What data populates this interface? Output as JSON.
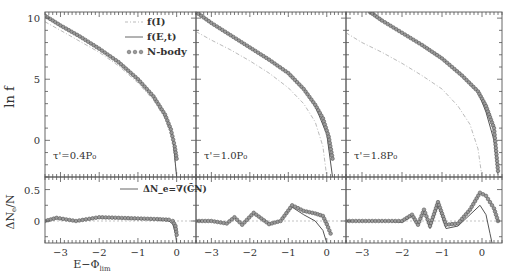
{
  "figure": {
    "ylabel_top": "ln f",
    "ylabel_bottom": "ΔN_e/N",
    "xlabel": "E−Φ_lim",
    "legend": {
      "fI": "f(I)",
      "fEt": "f(E,t)",
      "nbody": "N-body",
      "delta": "ΔN_e=∇(C̃N)"
    },
    "panels": [
      {
        "label": "τ'=0.4P₀"
      },
      {
        "label": "τ'=1.0P₀"
      },
      {
        "label": "τ'=1.8P₀"
      }
    ],
    "top_yticks": [
      "10",
      "5",
      "0"
    ],
    "bottom_yticks": [
      "0.5",
      "0"
    ],
    "xticks": [
      "−3",
      "−2",
      "−1",
      "0"
    ]
  },
  "chart_data": [
    {
      "type": "line",
      "title": "Top row: ln f vs E−Φ_lim",
      "xlabel": "E−Φ_lim",
      "ylabel": "ln f",
      "xlim": [
        -3.4,
        0.5
      ],
      "ylim": [
        -3,
        10.5
      ],
      "panels": [
        {
          "label": "τ'=0.4P₀",
          "series": [
            {
              "name": "f(I)",
              "style": "dash-dot",
              "x": [
                -3.4,
                -3,
                -2.5,
                -2,
                -1.5,
                -1,
                -0.6,
                -0.3,
                -0.1,
                0.0
              ],
              "y": [
                9.7,
                9.0,
                8.1,
                7.2,
                6.1,
                4.7,
                3.3,
                1.8,
                0.0,
                -3.0
              ]
            },
            {
              "name": "f(E,t)",
              "style": "solid",
              "x": [
                -3.4,
                -3,
                -2.5,
                -2,
                -1.5,
                -1,
                -0.6,
                -0.3,
                -0.1,
                0.0
              ],
              "y": [
                10.2,
                9.4,
                8.5,
                7.5,
                6.4,
                5.0,
                3.6,
                2.0,
                0.3,
                -3.0
              ]
            },
            {
              "name": "N-body",
              "style": "markers",
              "x": [
                -3.4,
                -3,
                -2.5,
                -2,
                -1.5,
                -1,
                -0.6,
                -0.3,
                -0.15,
                -0.05,
                0.0
              ],
              "y": [
                10.2,
                9.4,
                8.5,
                7.5,
                6.4,
                5.0,
                3.6,
                2.1,
                0.9,
                -0.5,
                -1.5
              ]
            }
          ]
        },
        {
          "label": "τ'=1.0P₀",
          "series": [
            {
              "name": "f(I)",
              "style": "dash-dot",
              "x": [
                -3.4,
                -3,
                -2.5,
                -2,
                -1.5,
                -1,
                -0.6,
                -0.3,
                -0.1,
                0.0
              ],
              "y": [
                8.9,
                8.2,
                7.4,
                6.5,
                5.5,
                4.3,
                3.0,
                1.5,
                -0.5,
                -3.0
              ]
            },
            {
              "name": "f(E,t)",
              "style": "solid",
              "x": [
                -3.4,
                -3,
                -2.5,
                -2,
                -1.5,
                -1,
                -0.6,
                -0.3,
                0.0,
                0.15
              ],
              "y": [
                10.5,
                9.6,
                8.6,
                7.6,
                6.6,
                5.5,
                4.2,
                2.8,
                0.5,
                -3.0
              ]
            },
            {
              "name": "N-body",
              "style": "markers",
              "x": [
                -3.4,
                -3,
                -2.5,
                -2,
                -1.5,
                -1,
                -0.6,
                -0.3,
                -0.1,
                0.05,
                0.15
              ],
              "y": [
                10.5,
                9.6,
                8.6,
                7.6,
                6.6,
                5.5,
                4.2,
                2.9,
                1.8,
                0.3,
                -1.5
              ]
            }
          ]
        },
        {
          "label": "τ'=1.8P₀",
          "series": [
            {
              "name": "f(I)",
              "style": "dash-dot",
              "x": [
                -3.4,
                -3,
                -2.5,
                -2,
                -1.5,
                -1,
                -0.6,
                -0.3,
                -0.1,
                0.0
              ],
              "y": [
                8.8,
                8.0,
                7.2,
                6.3,
                5.3,
                4.2,
                2.8,
                1.3,
                -0.7,
                -3.0
              ]
            },
            {
              "name": "f(E,t)",
              "style": "solid",
              "x": [
                -2.8,
                -2.5,
                -2,
                -1.5,
                -1,
                -0.5,
                -0.1,
                0.1,
                0.3,
                0.4
              ],
              "y": [
                10.5,
                9.8,
                8.8,
                7.8,
                6.7,
                5.3,
                4.0,
                2.3,
                0.0,
                -2.8
              ]
            },
            {
              "name": "N-body",
              "style": "markers",
              "x": [
                -2.8,
                -2.5,
                -2,
                -1.5,
                -1,
                -0.5,
                -0.1,
                0.0,
                0.1,
                0.2,
                0.3,
                0.4
              ],
              "y": [
                10.5,
                9.8,
                8.8,
                7.8,
                6.7,
                5.3,
                4.0,
                3.4,
                2.8,
                1.9,
                1.0,
                -2.5
              ]
            }
          ]
        }
      ]
    },
    {
      "type": "line",
      "title": "Bottom row: ΔN_e/N vs E−Φ_lim",
      "xlabel": "E−Φ_lim",
      "ylabel": "ΔN_e/N",
      "xlim": [
        -3.4,
        0.5
      ],
      "ylim": [
        -0.35,
        0.7
      ],
      "reference_line": {
        "y": 0,
        "style": "dotted"
      },
      "panels": [
        {
          "label": "τ'=0.4P₀",
          "series": [
            {
              "name": "ΔN_e=∇(C̃N)",
              "style": "solid",
              "x": [
                -3.4,
                -3.1,
                -2.6,
                -2.0,
                -1.5,
                -1.0,
                -0.5,
                -0.2,
                -0.1,
                -0.03,
                0.0
              ],
              "y": [
                0.0,
                0.04,
                0.0,
                0.05,
                0.04,
                0.03,
                0.02,
                0.0,
                -0.05,
                -0.2,
                -0.35
              ]
            },
            {
              "name": "N-body",
              "style": "markers",
              "x": [
                -3.4,
                -3.1,
                -2.6,
                -2.0,
                -1.5,
                -1.0,
                -0.5,
                -0.2,
                -0.1,
                -0.03,
                0.0
              ],
              "y": [
                0.0,
                0.05,
                0.0,
                0.06,
                0.05,
                0.04,
                0.03,
                0.02,
                0.0,
                -0.08,
                -0.22
              ]
            }
          ]
        },
        {
          "label": "τ'=1.0P₀",
          "series": [
            {
              "name": "ΔN_e=∇(C̃N)",
              "style": "solid",
              "x": [
                -3.4,
                -3.0,
                -2.6,
                -2.4,
                -2.2,
                -1.9,
                -1.5,
                -1.2,
                -0.9,
                -0.6,
                -0.3,
                -0.1,
                0.0
              ],
              "y": [
                0.0,
                0.0,
                -0.04,
                0.06,
                -0.06,
                0.12,
                -0.05,
                0.0,
                0.22,
                0.1,
                0.0,
                -0.15,
                -0.35
              ]
            },
            {
              "name": "N-body",
              "style": "markers",
              "x": [
                -3.4,
                -3.0,
                -2.6,
                -2.4,
                -2.2,
                -1.9,
                -1.5,
                -1.2,
                -0.9,
                -0.6,
                -0.3,
                -0.1,
                0.0,
                0.1
              ],
              "y": [
                0.0,
                0.0,
                -0.04,
                0.06,
                -0.06,
                0.13,
                -0.05,
                0.0,
                0.25,
                0.16,
                0.12,
                0.08,
                -0.05,
                -0.2
              ]
            }
          ]
        },
        {
          "label": "τ'=1.8P₀",
          "series": [
            {
              "name": "ΔN_e=∇(C̃N)",
              "style": "solid",
              "x": [
                -3.4,
                -2.5,
                -2.0,
                -1.75,
                -1.6,
                -1.45,
                -1.3,
                -1.1,
                -0.9,
                -0.6,
                -0.3,
                -0.05,
                0.1,
                0.2,
                0.25
              ],
              "y": [
                0.0,
                0.0,
                -0.02,
                0.08,
                -0.08,
                0.15,
                -0.12,
                0.25,
                -0.12,
                -0.08,
                0.1,
                0.25,
                0.1,
                -0.2,
                -0.35
              ]
            },
            {
              "name": "N-body",
              "style": "markers",
              "x": [
                -3.4,
                -2.5,
                -2.0,
                -1.75,
                -1.6,
                -1.45,
                -1.3,
                -1.1,
                -0.9,
                -0.6,
                -0.3,
                -0.05,
                0.1,
                0.2,
                0.3,
                0.4
              ],
              "y": [
                0.0,
                0.0,
                0.0,
                0.1,
                -0.06,
                0.18,
                -0.08,
                0.3,
                -0.06,
                -0.04,
                0.18,
                0.45,
                0.4,
                0.3,
                0.2,
                0.0
              ]
            }
          ]
        }
      ]
    }
  ]
}
